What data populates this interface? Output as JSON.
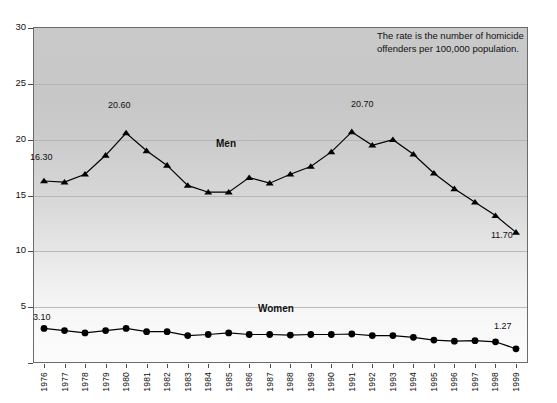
{
  "annotation": {
    "text": "The rate is the number of homicide\noffenders per 100,000 population."
  },
  "axis": {
    "y_ticks": [
      "0",
      "5",
      "10",
      "15",
      "20",
      "25",
      "30"
    ],
    "x_ticks": [
      "1976",
      "1977",
      "1978",
      "1979",
      "1980",
      "1981",
      "1982",
      "1983",
      "1984",
      "1985",
      "1986",
      "1987",
      "1988",
      "1989",
      "1990",
      "1991",
      "1992",
      "1993",
      "1994",
      "1995",
      "1996",
      "1997",
      "1998",
      "1999"
    ]
  },
  "series_labels": {
    "men": "Men",
    "women": "Women"
  },
  "point_labels": {
    "men_first": "16.30",
    "men_peak_1980": "20.60",
    "men_peak_1991": "20.70",
    "men_last": "11.70",
    "women_first": "3.10",
    "women_last": "1.27"
  },
  "colors": {
    "line": "#000000",
    "frame": "#6b6b6b",
    "grid": "#b0b0b0",
    "text": "#111111",
    "plot_top": "#c9c9c9",
    "plot_bottom": "#fcfcfc"
  },
  "chart_data": {
    "type": "line",
    "title": "",
    "subtitle": "",
    "xlabel": "",
    "ylabel": "",
    "ylim": [
      0,
      30
    ],
    "ytick_step": 5,
    "grid": true,
    "legend": "inline-labels",
    "x": [
      "1976",
      "1977",
      "1978",
      "1979",
      "1980",
      "1981",
      "1982",
      "1983",
      "1984",
      "1985",
      "1986",
      "1987",
      "1988",
      "1989",
      "1990",
      "1991",
      "1992",
      "1993",
      "1994",
      "1995",
      "1996",
      "1997",
      "1998",
      "1999"
    ],
    "series": [
      {
        "name": "Men",
        "marker": "triangle",
        "values": [
          16.3,
          16.2,
          16.9,
          18.6,
          20.6,
          19.0,
          17.7,
          15.9,
          15.3,
          15.3,
          16.6,
          16.1,
          16.9,
          17.6,
          18.9,
          20.7,
          19.5,
          20.0,
          18.7,
          17.0,
          15.6,
          14.4,
          13.2,
          11.7
        ]
      },
      {
        "name": "Women",
        "marker": "circle",
        "values": [
          3.1,
          2.9,
          2.7,
          2.9,
          3.1,
          2.8,
          2.8,
          2.45,
          2.55,
          2.7,
          2.55,
          2.55,
          2.5,
          2.55,
          2.55,
          2.6,
          2.45,
          2.45,
          2.3,
          2.05,
          1.95,
          2.0,
          1.9,
          1.27
        ]
      }
    ],
    "annotations": [
      {
        "series": "Men",
        "x": "1976",
        "label": "16.30"
      },
      {
        "series": "Men",
        "x": "1980",
        "label": "20.60"
      },
      {
        "series": "Men",
        "x": "1991",
        "label": "20.70"
      },
      {
        "series": "Men",
        "x": "1999",
        "label": "11.70"
      },
      {
        "series": "Women",
        "x": "1976",
        "label": "3.10"
      },
      {
        "series": "Women",
        "x": "1999",
        "label": "1.27"
      }
    ]
  }
}
